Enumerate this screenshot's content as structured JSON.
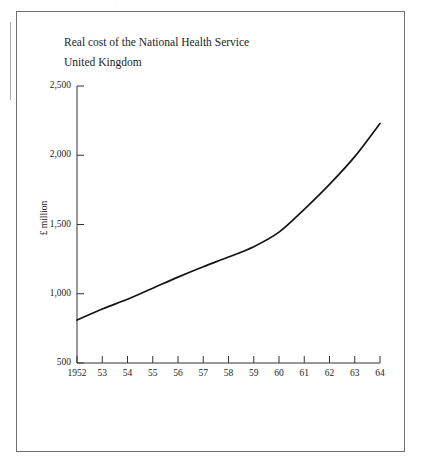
{
  "figure": {
    "title": "Real cost of the National Health Service",
    "subtitle": "United Kingdom",
    "scan_artifact_text": "· · ·  ·   ·  ·     ·    ·      ·   ·      ·    ·"
  },
  "chart_data": {
    "type": "line",
    "title": "Real cost of the National Health Service",
    "subtitle": "United Kingdom",
    "xlabel": "",
    "ylabel": "£ million",
    "ylim": [
      500,
      2500
    ],
    "xlim": [
      1952,
      1964
    ],
    "yticks": [
      500,
      1000,
      1500,
      2000,
      2500
    ],
    "ytick_labels": [
      "500",
      "1,000",
      "1,500",
      "2,000",
      "2,500"
    ],
    "xticks": [
      1952,
      1953,
      1954,
      1955,
      1956,
      1957,
      1958,
      1959,
      1960,
      1961,
      1962,
      1963,
      1964
    ],
    "xtick_labels": [
      "1952",
      "53",
      "54",
      "55",
      "56",
      "57",
      "58",
      "59",
      "60",
      "61",
      "62",
      "63",
      "64"
    ],
    "grid": false,
    "legend": false,
    "series": [
      {
        "name": "Real cost of the NHS",
        "x": [
          1952,
          1953,
          1954,
          1955,
          1956,
          1957,
          1958,
          1959,
          1960,
          1961,
          1962,
          1963,
          1964
        ],
        "values": [
          810,
          890,
          960,
          1040,
          1120,
          1195,
          1265,
          1340,
          1445,
          1610,
          1790,
          1990,
          2230
        ],
        "color": "#141414"
      }
    ]
  }
}
